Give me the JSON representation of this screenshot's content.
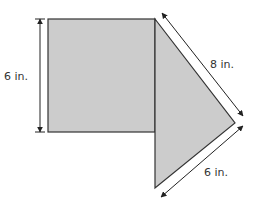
{
  "diagram": {
    "type": "composite-figure",
    "colors": {
      "fill": "#cccccc",
      "stroke": "#333333",
      "dim_line": "#222222"
    },
    "shapes": [
      {
        "name": "square",
        "side": "6 in."
      },
      {
        "name": "triangle",
        "sides": [
          "8 in.",
          "6 in."
        ]
      }
    ],
    "labels": {
      "square_height": "6 in.",
      "triangle_upper_side": "8 in.",
      "triangle_lower_side": "6 in."
    }
  }
}
